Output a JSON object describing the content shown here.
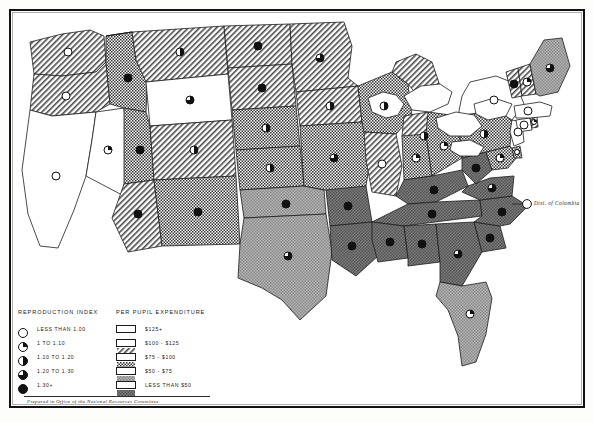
{
  "figure": {
    "credit": "Prepared in Office of the National Resources Committee",
    "annotation_dc": "Dist. of Columbia"
  },
  "legend_left": {
    "title": "REPRODUCTION INDEX",
    "items": [
      {
        "label": "LESS THAN 1.00",
        "symbol": "circle-empty",
        "fill": 0.0
      },
      {
        "label": "1 TO 1.10",
        "symbol": "circle-quarter",
        "fill": 0.25
      },
      {
        "label": "1.10 TO 1.20",
        "symbol": "circle-half",
        "fill": 0.5
      },
      {
        "label": "1.20 TO 1.30",
        "symbol": "circle-three-quarter",
        "fill": 0.75
      },
      {
        "label": "1.30+",
        "symbol": "circle-full",
        "fill": 1.0
      }
    ]
  },
  "legend_right": {
    "title": "PER PUPIL EXPENDITURE",
    "items": [
      {
        "label": "$125+",
        "pattern": "white",
        "color": "#ffffff"
      },
      {
        "label": "$100 - $125",
        "pattern": "hatch",
        "color": "#d8d8d8"
      },
      {
        "label": "$75 - $100",
        "pattern": "checker",
        "color": "#bdbdbd"
      },
      {
        "label": "$50 - $75",
        "pattern": "gray",
        "color": "#9c9c9c"
      },
      {
        "label": "LESS THAN $50",
        "pattern": "darkgray",
        "color": "#6e6e6e"
      }
    ]
  },
  "chart_data": {
    "type": "map",
    "region": "United States",
    "encodings": {
      "area_fill": "per_pupil_expenditure",
      "point_symbol": "reproduction_index"
    },
    "states": [
      {
        "code": "WA",
        "name": "Washington",
        "expenditure": "$100 - $125",
        "pattern": "hatch",
        "index": "LESS THAN 1.00",
        "fill": 0.0
      },
      {
        "code": "OR",
        "name": "Oregon",
        "expenditure": "$100 - $125",
        "pattern": "hatch",
        "index": "LESS THAN 1.00",
        "fill": 0.0
      },
      {
        "code": "CA",
        "name": "California",
        "expenditure": "$125+",
        "pattern": "white",
        "index": "LESS THAN 1.00",
        "fill": 0.0
      },
      {
        "code": "NV",
        "name": "Nevada",
        "expenditure": "$125+",
        "pattern": "white",
        "index": "1 TO 1.10",
        "fill": 0.25
      },
      {
        "code": "ID",
        "name": "Idaho",
        "expenditure": "$75 - $100",
        "pattern": "checker",
        "index": "1.30+",
        "fill": 1.0
      },
      {
        "code": "UT",
        "name": "Utah",
        "expenditure": "$75 - $100",
        "pattern": "checker",
        "index": "1.30+",
        "fill": 1.0
      },
      {
        "code": "MT",
        "name": "Montana",
        "expenditure": "$100 - $125",
        "pattern": "hatch",
        "index": "1.10 TO 1.20",
        "fill": 0.5
      },
      {
        "code": "WY",
        "name": "Wyoming",
        "expenditure": "$125+",
        "pattern": "white",
        "index": "1.20 TO 1.30",
        "fill": 0.75
      },
      {
        "code": "AZ",
        "name": "Arizona",
        "expenditure": "$100 - $125",
        "pattern": "hatch",
        "index": "1.30+",
        "fill": 1.0
      },
      {
        "code": "CO",
        "name": "Colorado",
        "expenditure": "$100 - $125",
        "pattern": "hatch",
        "index": "1.10 TO 1.20",
        "fill": 0.5
      },
      {
        "code": "NM",
        "name": "New Mexico",
        "expenditure": "$75 - $100",
        "pattern": "checker",
        "index": "1.30+",
        "fill": 1.0
      },
      {
        "code": "ND",
        "name": "North Dakota",
        "expenditure": "$100 - $125",
        "pattern": "hatch",
        "index": "1.30+",
        "fill": 1.0
      },
      {
        "code": "SD",
        "name": "South Dakota",
        "expenditure": "$100 - $125",
        "pattern": "hatch",
        "index": "1.30+",
        "fill": 1.0
      },
      {
        "code": "NE",
        "name": "Nebraska",
        "expenditure": "$75 - $100",
        "pattern": "checker",
        "index": "1.10 TO 1.20",
        "fill": 0.5
      },
      {
        "code": "KS",
        "name": "Kansas",
        "expenditure": "$75 - $100",
        "pattern": "checker",
        "index": "1.10 TO 1.20",
        "fill": 0.5
      },
      {
        "code": "OK",
        "name": "Oklahoma",
        "expenditure": "$50 - $75",
        "pattern": "gray",
        "index": "1.30+",
        "fill": 1.0
      },
      {
        "code": "TX",
        "name": "Texas",
        "expenditure": "$50 - $75",
        "pattern": "gray",
        "index": "1.20 TO 1.30",
        "fill": 0.75
      },
      {
        "code": "MN",
        "name": "Minnesota",
        "expenditure": "$100 - $125",
        "pattern": "hatch",
        "index": "1.20 TO 1.30",
        "fill": 0.75
      },
      {
        "code": "IA",
        "name": "Iowa",
        "expenditure": "$100 - $125",
        "pattern": "hatch",
        "index": "1.10 TO 1.20",
        "fill": 0.5
      },
      {
        "code": "MO",
        "name": "Missouri",
        "expenditure": "$75 - $100",
        "pattern": "checker",
        "index": "1.20 TO 1.30",
        "fill": 0.75
      },
      {
        "code": "AR",
        "name": "Arkansas",
        "expenditure": "LESS THAN $50",
        "pattern": "darkgray",
        "index": "1.30+",
        "fill": 1.0
      },
      {
        "code": "LA",
        "name": "Louisiana",
        "expenditure": "LESS THAN $50",
        "pattern": "darkgray",
        "index": "1.30+",
        "fill": 1.0
      },
      {
        "code": "WI",
        "name": "Wisconsin",
        "expenditure": "$75 - $100",
        "pattern": "checker",
        "index": "1.10 TO 1.20",
        "fill": 0.5
      },
      {
        "code": "IL",
        "name": "Illinois",
        "expenditure": "$100 - $125",
        "pattern": "hatch",
        "index": "LESS THAN 1.00",
        "fill": 0.0
      },
      {
        "code": "MI",
        "name": "Michigan",
        "expenditure": "$100 - $125",
        "pattern": "hatch",
        "index": "1.10 TO 1.20",
        "fill": 0.5
      },
      {
        "code": "IN",
        "name": "Indiana",
        "expenditure": "$75 - $100",
        "pattern": "checker",
        "index": "1 TO 1.10",
        "fill": 0.25
      },
      {
        "code": "OH",
        "name": "Ohio",
        "expenditure": "$75 - $100",
        "pattern": "checker",
        "index": "1 TO 1.10",
        "fill": 0.25
      },
      {
        "code": "KY",
        "name": "Kentucky",
        "expenditure": "LESS THAN $50",
        "pattern": "darkgray",
        "index": "1.30+",
        "fill": 1.0
      },
      {
        "code": "TN",
        "name": "Tennessee",
        "expenditure": "LESS THAN $50",
        "pattern": "darkgray",
        "index": "1.30+",
        "fill": 1.0
      },
      {
        "code": "MS",
        "name": "Mississippi",
        "expenditure": "LESS THAN $50",
        "pattern": "darkgray",
        "index": "1.30+",
        "fill": 1.0
      },
      {
        "code": "AL",
        "name": "Alabama",
        "expenditure": "LESS THAN $50",
        "pattern": "darkgray",
        "index": "1.30+",
        "fill": 1.0
      },
      {
        "code": "GA",
        "name": "Georgia",
        "expenditure": "LESS THAN $50",
        "pattern": "darkgray",
        "index": "1.20 TO 1.30",
        "fill": 0.75
      },
      {
        "code": "FL",
        "name": "Florida",
        "expenditure": "$50 - $75",
        "pattern": "gray",
        "index": "1 TO 1.10",
        "fill": 0.25
      },
      {
        "code": "SC",
        "name": "South Carolina",
        "expenditure": "LESS THAN $50",
        "pattern": "darkgray",
        "index": "1.30+",
        "fill": 1.0
      },
      {
        "code": "NC",
        "name": "North Carolina",
        "expenditure": "LESS THAN $50",
        "pattern": "darkgray",
        "index": "1.30+",
        "fill": 1.0
      },
      {
        "code": "VA",
        "name": "Virginia",
        "expenditure": "LESS THAN $50",
        "pattern": "darkgray",
        "index": "1.20 TO 1.30",
        "fill": 0.75
      },
      {
        "code": "WV",
        "name": "West Virginia",
        "expenditure": "LESS THAN $50",
        "pattern": "darkgray",
        "index": "1.30+",
        "fill": 1.0
      },
      {
        "code": "MD",
        "name": "Maryland",
        "expenditure": "$75 - $100",
        "pattern": "checker",
        "index": "1 TO 1.10",
        "fill": 0.25
      },
      {
        "code": "DE",
        "name": "Delaware",
        "expenditure": "$75 - $100",
        "pattern": "checker",
        "index": "LESS THAN 1.00",
        "fill": 0.0
      },
      {
        "code": "PA",
        "name": "Pennsylvania",
        "expenditure": "$75 - $100",
        "pattern": "checker",
        "index": "1.10 TO 1.20",
        "fill": 0.5
      },
      {
        "code": "NJ",
        "name": "New Jersey",
        "expenditure": "$125+",
        "pattern": "white",
        "index": "LESS THAN 1.00",
        "fill": 0.0
      },
      {
        "code": "NY",
        "name": "New York",
        "expenditure": "$125+",
        "pattern": "white",
        "index": "LESS THAN 1.00",
        "fill": 0.0
      },
      {
        "code": "CT",
        "name": "Connecticut",
        "expenditure": "$125+",
        "pattern": "white",
        "index": "LESS THAN 1.00",
        "fill": 0.0
      },
      {
        "code": "RI",
        "name": "Rhode Island",
        "expenditure": "$100 - $125",
        "pattern": "hatch",
        "index": "1 TO 1.10",
        "fill": 0.25
      },
      {
        "code": "MA",
        "name": "Massachusetts",
        "expenditure": "$125+",
        "pattern": "white",
        "index": "LESS THAN 1.00",
        "fill": 0.0
      },
      {
        "code": "VT",
        "name": "Vermont",
        "expenditure": "$100 - $125",
        "pattern": "hatch",
        "index": "1.30+",
        "fill": 1.0
      },
      {
        "code": "NH",
        "name": "New Hampshire",
        "expenditure": "$100 - $125",
        "pattern": "hatch",
        "index": "1 TO 1.10",
        "fill": 0.25
      },
      {
        "code": "ME",
        "name": "Maine",
        "expenditure": "$50 - $75",
        "pattern": "gray",
        "index": "1.20 TO 1.30",
        "fill": 0.75
      },
      {
        "code": "DC",
        "name": "Dist. of Columbia",
        "expenditure": "$125+",
        "pattern": "white",
        "index": "LESS THAN 1.00",
        "fill": 0.0
      }
    ]
  }
}
